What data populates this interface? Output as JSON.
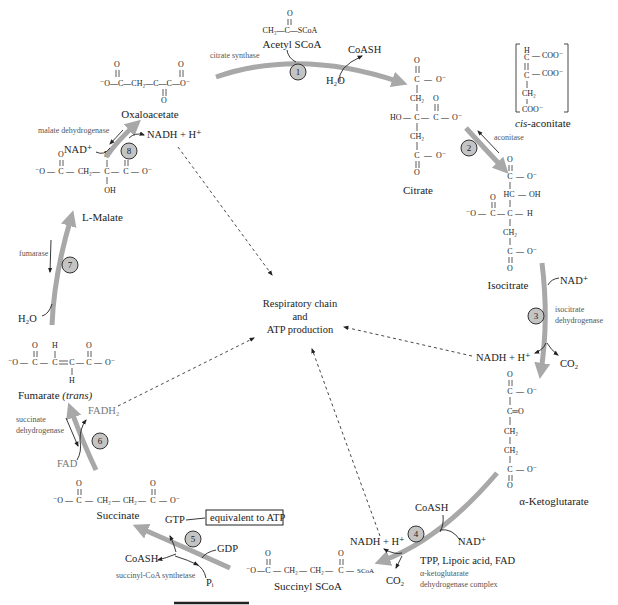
{
  "center": {
    "line1": "Respiratory chain",
    "line2": "and",
    "line3": "ATP production"
  },
  "colors": {
    "arc": "#a8a8a8",
    "step_circle": "#c4c4c4",
    "text": "#222222",
    "enzyme_text": "#555555"
  },
  "compounds": {
    "acetyl_scoa": {
      "name": "Acetyl SCoA",
      "formula_top": "O",
      "formula": "CH₃—C—SCoA"
    },
    "oxaloacetate": {
      "name": "Oxaloacetate",
      "formula": "⁻O—C—CH₂—C—C—O⁻",
      "o_top": "O",
      "o_bottom": "O"
    },
    "citrate": {
      "name": "Citrate",
      "ho": "HO",
      "ch2": "CH₂",
      "c": "C",
      "o": "O",
      "om": "O⁻"
    },
    "cis_aconitate": {
      "name_italic": "cis",
      "name_rest": "-aconitate",
      "h": "H",
      "c": "C",
      "coo": "COO⁻",
      "ch2": "CH₂"
    },
    "isocitrate": {
      "name": "Isocitrate",
      "hc": "HC",
      "oh": "OH",
      "h": "H"
    },
    "alpha_ketoglutarate": {
      "name": "α-Ketoglutarate"
    },
    "succinyl_scoa": {
      "name": "Succinyl SCoA",
      "scoa": "SCoA"
    },
    "succinate": {
      "name": "Succinate"
    },
    "fumarate": {
      "name": "Fumarate",
      "name_italic": "(trans)"
    },
    "malate": {
      "name": "L-Malate",
      "oh": "OH"
    }
  },
  "steps": [
    {
      "number": "1",
      "enzyme": "citrate synthase",
      "inputs": [
        "H₂O"
      ],
      "outputs": [
        "CoASH"
      ]
    },
    {
      "number": "2",
      "enzyme": "aconitase"
    },
    {
      "number": "3",
      "enzyme_line1": "isocitrate",
      "enzyme_line2": "dehydrogenase",
      "inputs": [
        "NAD⁺"
      ],
      "outputs": [
        "NADH + H⁺",
        "CO₂"
      ]
    },
    {
      "number": "4",
      "enzyme_line1": "α-ketoglutarate",
      "enzyme_line2": "dehydrogenase complex",
      "cofactors": "TPP, Lipoic acid, FAD",
      "inputs": [
        "CoASH",
        "NAD⁺"
      ],
      "outputs": [
        "NADH + H⁺",
        "CO₂"
      ]
    },
    {
      "number": "5",
      "enzyme": "succinyl-CoA synthetase",
      "inputs": [
        "GDP",
        "Pᵢ"
      ],
      "outputs": [
        "GTP",
        "CoASH"
      ],
      "note": "equivalent to ATP"
    },
    {
      "number": "6",
      "enzyme_line1": "succinate",
      "enzyme_line2": "dehydrogenase",
      "inputs": [
        "FAD"
      ],
      "outputs": [
        "FADH₂"
      ]
    },
    {
      "number": "7",
      "enzyme": "fumarase",
      "inputs": [
        "H₂O"
      ]
    },
    {
      "number": "8",
      "enzyme": "malate dehydrogenase",
      "inputs": [
        "NAD⁺"
      ],
      "outputs": [
        "NADH + H⁺"
      ]
    }
  ],
  "atoms": {
    "o": "O",
    "om": "O⁻",
    "mo": "⁻O",
    "c": "C",
    "ch2": "CH₂",
    "ceq": "C═O",
    "h": "H",
    "dash": "—",
    "eq": "="
  }
}
